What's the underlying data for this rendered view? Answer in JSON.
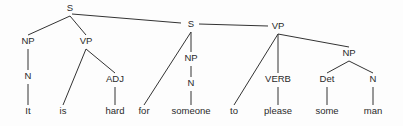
{
  "diagram": {
    "type": "syntax-tree",
    "nodes": [
      {
        "id": "s1",
        "label": "S",
        "x": 70,
        "y": 11
      },
      {
        "id": "np1",
        "label": "NP",
        "x": 28,
        "y": 44
      },
      {
        "id": "vp1",
        "label": "VP",
        "x": 86,
        "y": 44
      },
      {
        "id": "n1",
        "label": "N",
        "x": 28,
        "y": 79
      },
      {
        "id": "w_it",
        "label": "It",
        "x": 28,
        "y": 114
      },
      {
        "id": "w_is",
        "label": "is",
        "x": 63,
        "y": 114
      },
      {
        "id": "adj",
        "label": "ADJ",
        "x": 115,
        "y": 82
      },
      {
        "id": "w_hard",
        "label": "hard",
        "x": 115,
        "y": 114
      },
      {
        "id": "s2",
        "label": "S",
        "x": 191,
        "y": 27
      },
      {
        "id": "w_for",
        "label": "for",
        "x": 144,
        "y": 114
      },
      {
        "id": "np2",
        "label": "NP",
        "x": 191,
        "y": 61
      },
      {
        "id": "n2",
        "label": "N",
        "x": 191,
        "y": 86
      },
      {
        "id": "w_someone",
        "label": "someone",
        "x": 191,
        "y": 114
      },
      {
        "id": "vp2",
        "label": "VP",
        "x": 278,
        "y": 29
      },
      {
        "id": "w_to",
        "label": "to",
        "x": 234,
        "y": 114
      },
      {
        "id": "verb",
        "label": "VERB",
        "x": 278,
        "y": 82
      },
      {
        "id": "w_please",
        "label": "please",
        "x": 278,
        "y": 114
      },
      {
        "id": "np3",
        "label": "NP",
        "x": 349,
        "y": 56
      },
      {
        "id": "det",
        "label": "Det",
        "x": 327,
        "y": 82
      },
      {
        "id": "n3",
        "label": "N",
        "x": 373,
        "y": 82
      },
      {
        "id": "w_some",
        "label": "some",
        "x": 327,
        "y": 114
      },
      {
        "id": "w_man",
        "label": "man",
        "x": 373,
        "y": 114
      }
    ],
    "edges": [
      [
        "s1",
        "np1"
      ],
      [
        "s1",
        "vp1"
      ],
      [
        "s1",
        "s2"
      ],
      [
        "np1",
        "n1"
      ],
      [
        "n1",
        "w_it"
      ],
      [
        "vp1",
        "w_is"
      ],
      [
        "vp1",
        "adj"
      ],
      [
        "adj",
        "w_hard"
      ],
      [
        "s2",
        "w_for"
      ],
      [
        "s2",
        "np2"
      ],
      [
        "s2",
        "vp2"
      ],
      [
        "np2",
        "n2"
      ],
      [
        "n2",
        "w_someone"
      ],
      [
        "vp2",
        "w_to"
      ],
      [
        "vp2",
        "verb"
      ],
      [
        "vp2",
        "np3"
      ],
      [
        "verb",
        "w_please"
      ],
      [
        "np3",
        "det"
      ],
      [
        "np3",
        "n3"
      ],
      [
        "det",
        "w_some"
      ],
      [
        "n3",
        "w_man"
      ]
    ]
  }
}
